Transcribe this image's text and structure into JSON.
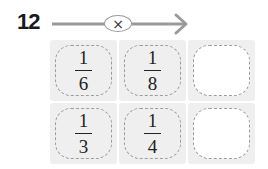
{
  "problem": {
    "number": "12",
    "operator": "×",
    "colors": {
      "line": "#9a9a9a",
      "cell_bg": "#efefef",
      "dash": "#9c9c9c"
    }
  },
  "grid": {
    "rows": [
      [
        {
          "numerator": "1",
          "denominator": "6",
          "empty": false
        },
        {
          "numerator": "1",
          "denominator": "8",
          "empty": false
        },
        {
          "numerator": "",
          "denominator": "",
          "empty": true
        }
      ],
      [
        {
          "numerator": "1",
          "denominator": "3",
          "empty": false
        },
        {
          "numerator": "1",
          "denominator": "4",
          "empty": false
        },
        {
          "numerator": "",
          "denominator": "",
          "empty": true
        }
      ]
    ]
  }
}
